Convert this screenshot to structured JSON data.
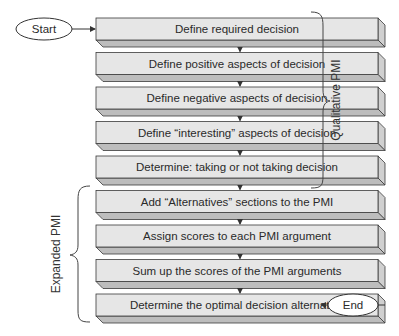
{
  "diagram": {
    "type": "flowchart",
    "start_label": "Start",
    "end_label": "End",
    "steps": [
      {
        "label": "Define required decision"
      },
      {
        "label": "Define positive aspects of decision"
      },
      {
        "label": "Define negative aspects of decision"
      },
      {
        "label": "Define “interesting” aspects of decision"
      },
      {
        "label": "Determine: taking or not taking decision"
      },
      {
        "label": "Add “Alternatives” sections to the PMI"
      },
      {
        "label": "Assign scores to each PMI argument"
      },
      {
        "label": "Sum up the scores of the PMI arguments"
      },
      {
        "label": "Determine the optimal decision alternative"
      }
    ],
    "groups": [
      {
        "label": "Qualitative PMI",
        "side": "right",
        "from_step": 0,
        "to_step": 4
      },
      {
        "label": "Expanded PMI",
        "side": "left",
        "from_step": 5,
        "to_step": 8
      }
    ],
    "colors": {
      "box_face": "#e6e6e6",
      "box_edge": "#bdbdbd",
      "stroke": "#3a3a3a",
      "background": "#ffffff"
    }
  }
}
